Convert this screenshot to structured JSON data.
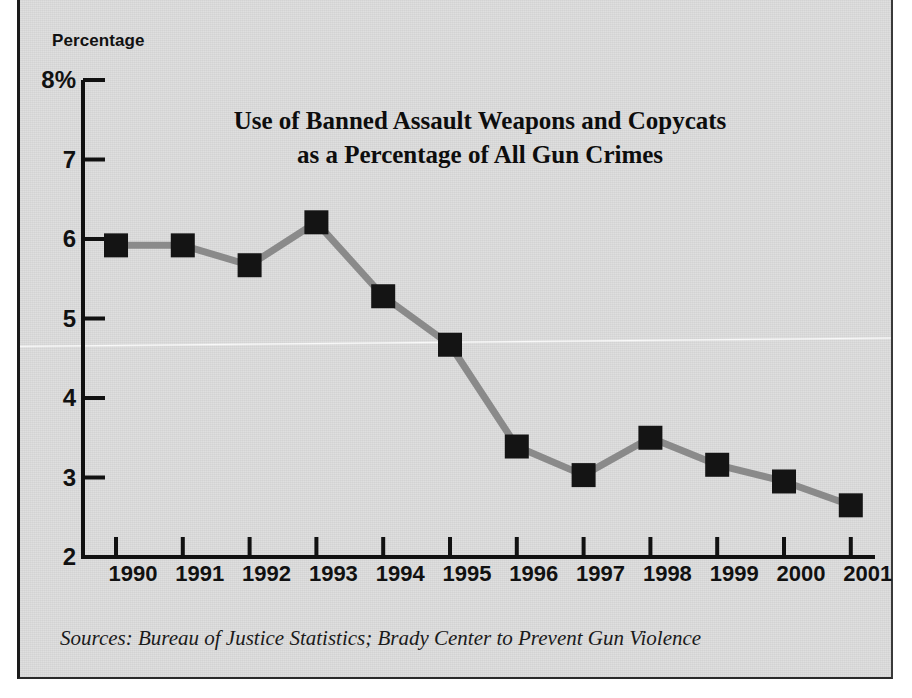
{
  "figure": {
    "axis_title": "Percentage",
    "sources": "Sources: Bureau of Justice Statistics; Brady Center to Prevent Gun Violence",
    "title_line1": "Use of Banned Assault Weapons and Copycats",
    "title_line2": "as a Percentage of All Gun Crimes"
  },
  "colors": {
    "paper": "#dedede",
    "border": "#1a1a1a",
    "axis": "#111111",
    "line": "#8a8a8a",
    "marker": "#141414",
    "text": "#111111"
  },
  "chart_data": {
    "type": "line",
    "title": "Use of Banned Assault Weapons and Copycats as a Percentage of All Gun Crimes",
    "subtitle": "",
    "xlabel": "",
    "ylabel": "Percentage",
    "ylim": [
      2,
      8
    ],
    "yticks": [
      2,
      3,
      4,
      5,
      6,
      7,
      8
    ],
    "ytick_labels": [
      "2",
      "3",
      "4",
      "5",
      "6",
      "7",
      "8%"
    ],
    "grid": false,
    "legend": false,
    "legend_position": "none",
    "categories": [
      "1990",
      "1991",
      "1992",
      "1993",
      "1994",
      "1995",
      "1996",
      "1997",
      "1998",
      "1999",
      "2000",
      "2001"
    ],
    "values": [
      5.92,
      5.92,
      5.67,
      6.21,
      5.28,
      4.67,
      3.39,
      3.03,
      3.5,
      3.16,
      2.95,
      2.65
    ],
    "series": [
      {
        "name": "Banned assault weapons and copycats share of gun crimes",
        "values": [
          5.92,
          5.92,
          5.67,
          6.21,
          5.28,
          4.67,
          3.39,
          3.03,
          3.5,
          3.16,
          2.95,
          2.65
        ]
      }
    ],
    "marker": "square",
    "units": "percent",
    "annotations": []
  }
}
